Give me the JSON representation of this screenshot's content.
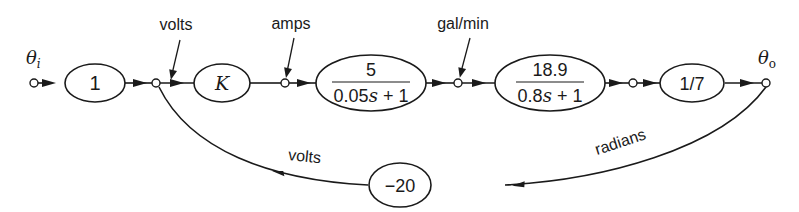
{
  "diagram": {
    "type": "signal-flow-graph",
    "input": {
      "symbol": "θ",
      "subscript": "i"
    },
    "output": {
      "symbol": "θ",
      "subscript": "o"
    },
    "forward_gains": [
      {
        "id": "g1",
        "label": "1"
      },
      {
        "id": "gK",
        "label": "K"
      },
      {
        "id": "g2",
        "numerator": "5",
        "denominator_a": "0.05",
        "denominator_s": "s",
        "denominator_b": " + 1"
      },
      {
        "id": "g3",
        "numerator": "18.9",
        "denominator_a": "0.8",
        "denominator_s": "s",
        "denominator_b": " + 1"
      },
      {
        "id": "g4",
        "label": "1/7"
      }
    ],
    "feedback_gain": {
      "label": "−20"
    },
    "signal_labels": {
      "volts_top": "volts",
      "amps": "amps",
      "gal_min": "gal/min",
      "radians": "radians",
      "volts_feedback": "volts"
    }
  }
}
